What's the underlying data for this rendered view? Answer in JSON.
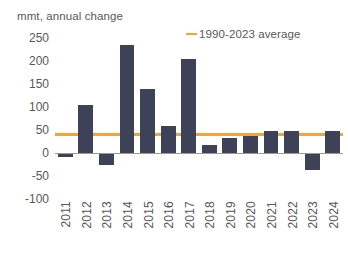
{
  "chart_data": {
    "type": "bar",
    "title": "mmt, annual change",
    "xlabel": "",
    "ylabel": "mmt, annual change",
    "ylim": [
      -100,
      250
    ],
    "yticks": [
      250,
      200,
      150,
      100,
      50,
      0,
      -50,
      -100
    ],
    "ytick_labels": [
      "250",
      "200",
      "150",
      "100",
      "50",
      "0",
      "-50",
      "-100"
    ],
    "grid": false,
    "legend_position": "top-right",
    "categories": [
      "2011",
      "2012",
      "2013",
      "2014",
      "2015",
      "2016",
      "2017",
      "2018",
      "2019",
      "2020",
      "2021",
      "2022",
      "2023",
      "2024"
    ],
    "values": [
      -8,
      105,
      -26,
      235,
      140,
      58,
      205,
      18,
      33,
      38,
      48,
      48,
      -38,
      48
    ],
    "series": [
      {
        "name": "annual change",
        "type": "bar",
        "color": "#3e4259",
        "values": [
          -8,
          105,
          -26,
          235,
          140,
          58,
          205,
          18,
          33,
          38,
          48,
          48,
          -38,
          48
        ]
      },
      {
        "name": "1990-2023 average",
        "type": "line",
        "color": "#f4a23b",
        "value": 42
      }
    ],
    "annotations": []
  },
  "legend": {
    "entries": [
      {
        "label": "1990-2023 average",
        "color": "#f4a23b",
        "marker": "line-dash"
      }
    ]
  },
  "colors": {
    "bar": "#3e4259",
    "average_line": "#f4a23b",
    "axis": "#9a9a9a",
    "text": "#585858",
    "background": "#ffffff"
  }
}
